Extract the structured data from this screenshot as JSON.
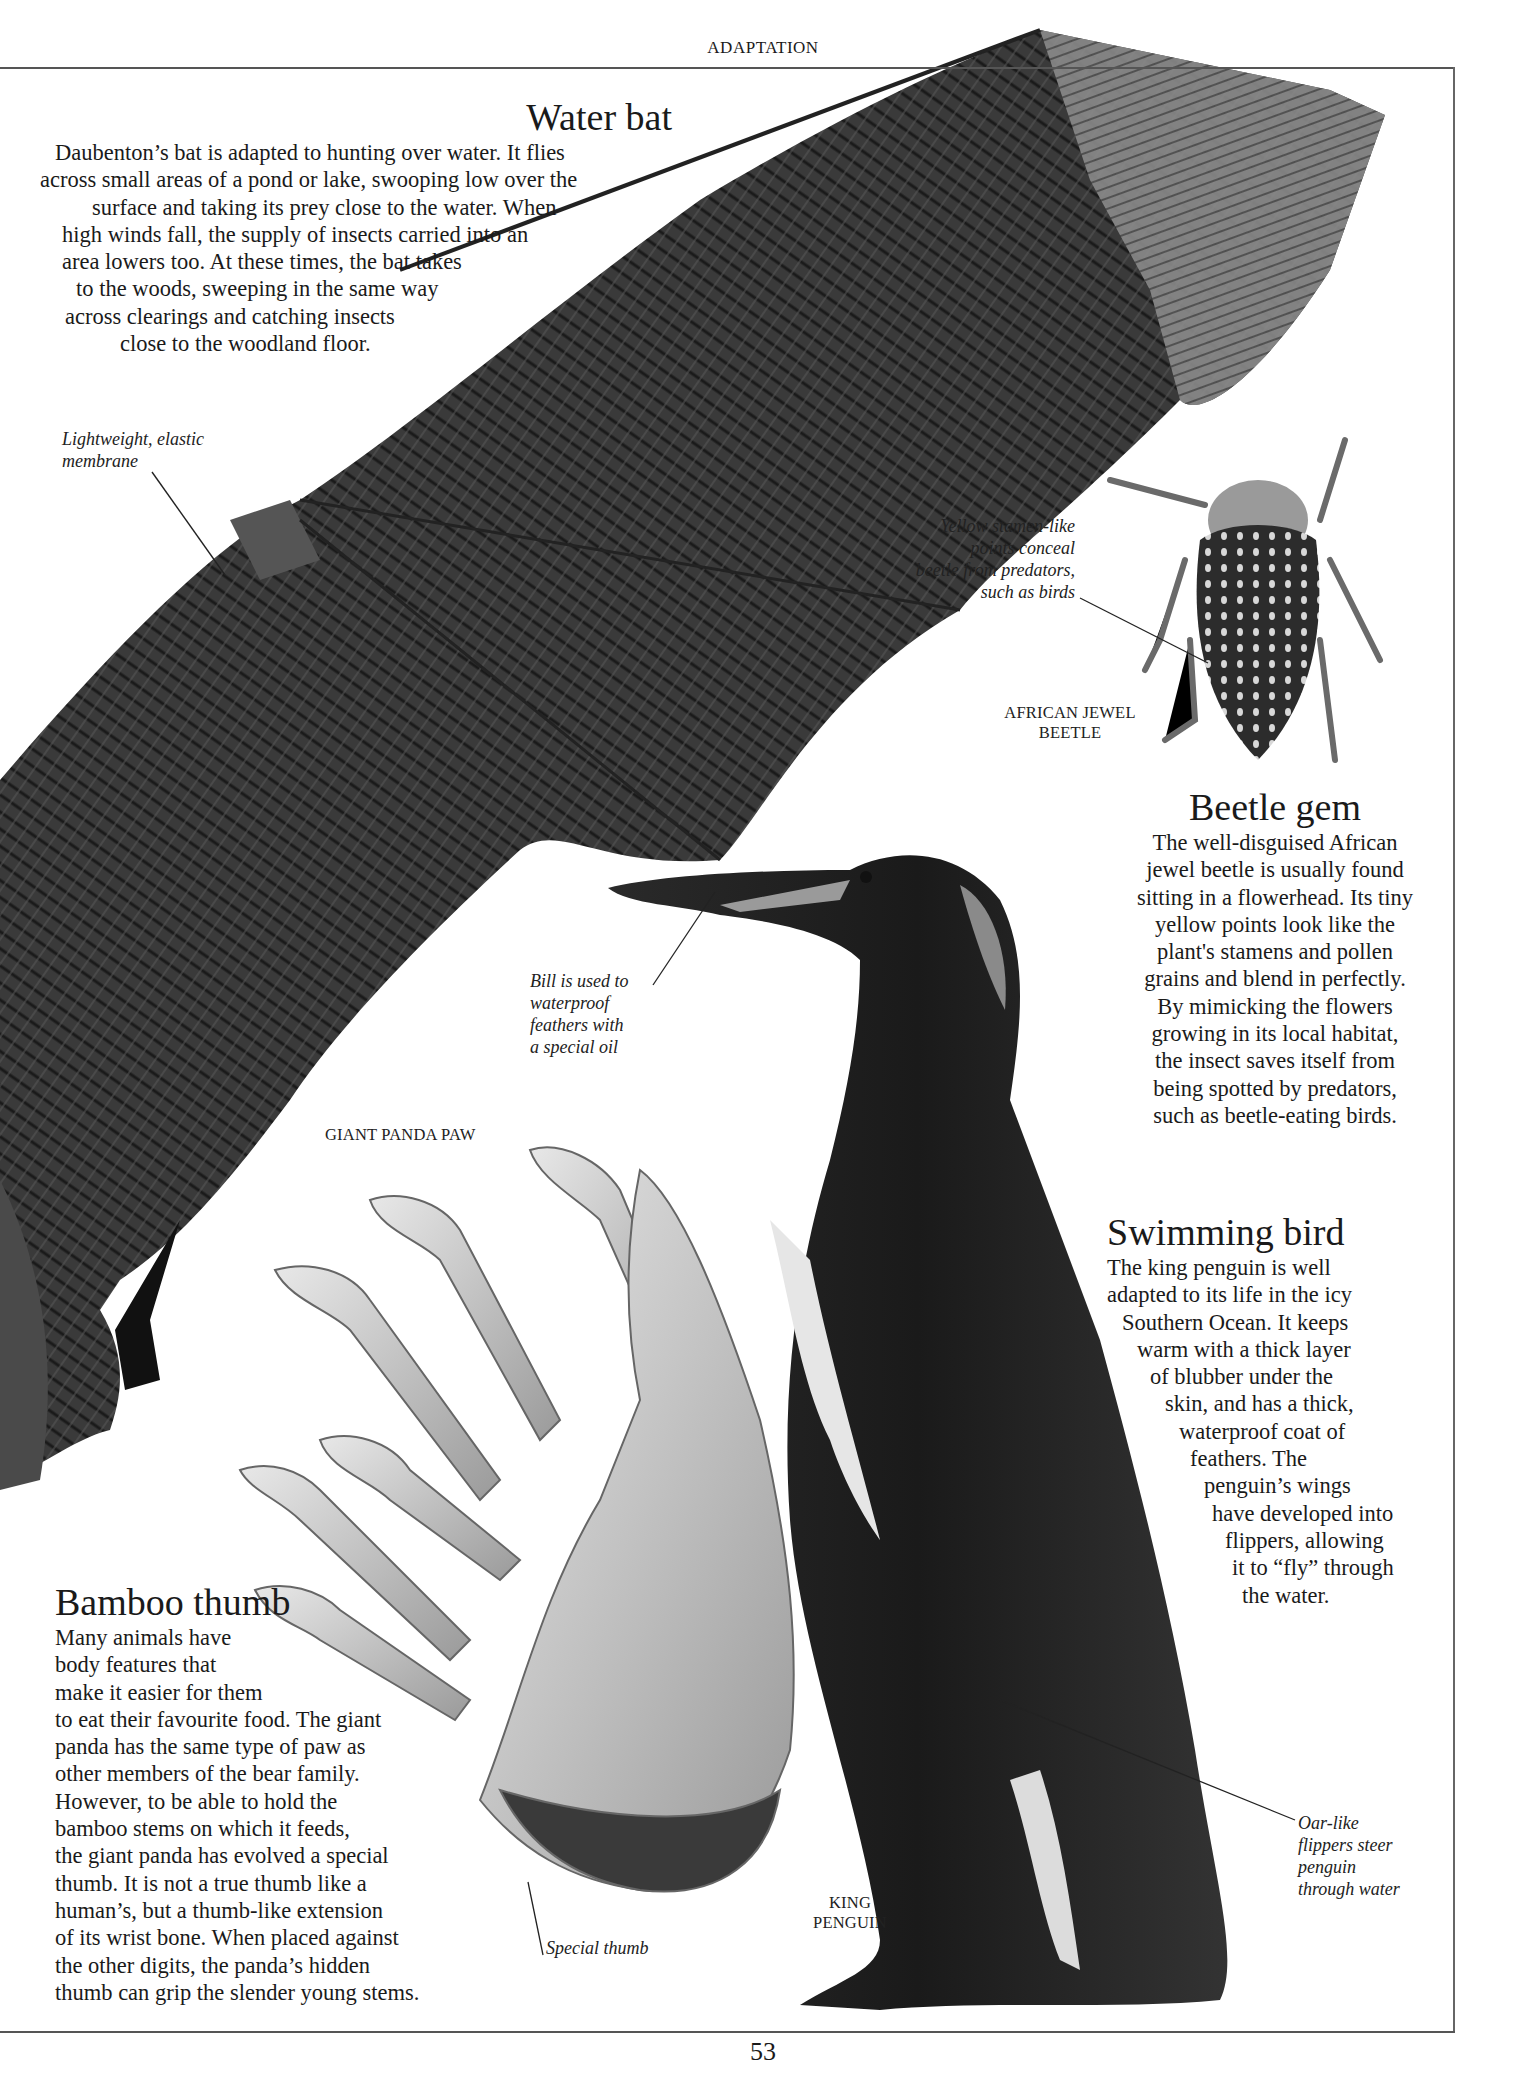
{
  "page": {
    "running_head": "ADAPTATION",
    "page_number": "53"
  },
  "water_bat": {
    "heading": "Water bat",
    "lines": [
      "Daubenton’s bat is adapted to hunting over water. It flies",
      "across small areas of a pond or lake, swooping low over the",
      "surface and taking its prey close to the water. When",
      "high winds fall, the supply of insects carried into an",
      "area lowers too. At these times, the bat takes",
      "to the woods, sweeping in the same way",
      "across clearings and catching insects",
      "close to the woodland floor."
    ],
    "caption": [
      "Lightweight, elastic",
      "membrane"
    ]
  },
  "beetle": {
    "caption": [
      "Yellow stamen-like",
      "points conceal",
      "beetle from predators,",
      "such as birds"
    ],
    "label": [
      "AFRICAN JEWEL",
      "BEETLE"
    ],
    "heading": "Beetle gem",
    "lines": [
      "The well-disguised African",
      "jewel beetle is usually found",
      "sitting in a flowerhead. Its tiny",
      "yellow points look like the",
      "plant's stamens and pollen",
      "grains and blend in perfectly.",
      "By mimicking the flowers",
      "growing in its local habitat,",
      "the insect saves itself from",
      "being spotted by predators,",
      "such as beetle-eating birds."
    ]
  },
  "penguin": {
    "bill_caption": [
      "Bill is used to",
      "waterproof",
      "feathers with",
      "a special oil"
    ],
    "heading": "Swimming bird",
    "lines": [
      "The king penguin is well",
      "adapted to its life in the icy",
      "Southern Ocean. It keeps",
      "warm with a thick layer",
      "of blubber under the",
      "skin, and has a thick,",
      "waterproof coat of",
      "feathers. The",
      "penguin’s wings",
      "have developed into",
      "flippers, allowing",
      "it to “fly” through",
      "the water."
    ],
    "flipper_caption": [
      "Oar-like",
      "flippers steer",
      "penguin",
      "through water"
    ],
    "label": [
      "KING",
      "PENGUIN"
    ]
  },
  "panda": {
    "label": "GIANT PANDA PAW",
    "heading": "Bamboo thumb",
    "lines": [
      "Many animals have",
      "body features that",
      "make it easier for them",
      "to eat their favourite food. The giant",
      "panda has the same type of paw as",
      "other members of the bear family.",
      "However, to be able to hold the",
      "bamboo stems on which it feeds,",
      "the giant panda has evolved a special",
      "thumb. It is not a true thumb like a",
      "human’s, but a thumb-like extension",
      "of its wrist bone. When placed against",
      "the other digits, the panda’s hidden",
      "thumb can grip the slender young stems."
    ],
    "thumb_caption": "Special thumb"
  }
}
